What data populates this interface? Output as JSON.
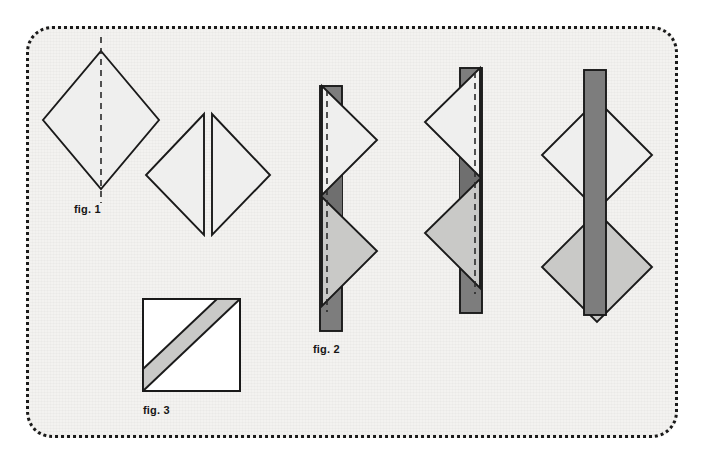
{
  "document": {
    "title": "Geometric Folding Diagram",
    "background_color": "#ffffff",
    "paper_color": "#f3f2f0",
    "border_style": "dotted-rounded-rectangle",
    "border_color": "#1a1a1a"
  },
  "palette": {
    "stroke": "#1a1a1a",
    "light_fill": "#efefee",
    "mid_fill": "#c9c9c7",
    "dark_fill": "#7d7d7d",
    "overlap_fill": "#6f6f6f",
    "paper": "#f3f2f0",
    "white": "#ffffff"
  },
  "labels": {
    "fig1": "fig. 1",
    "fig2": "fig. 2",
    "fig3": "fig. 3"
  },
  "figures": [
    {
      "id": "fig1",
      "label": "fig. 1",
      "description": "Light gray diamond with a vertical dashed fold line through its center",
      "shapes": [
        "diamond",
        "dashed-fold-line"
      ]
    },
    {
      "id": "fig1-split",
      "label": "",
      "description": "The same diamond separated into two mirrored triangles with a gap between them",
      "shapes": [
        "left-triangle",
        "right-triangle"
      ]
    },
    {
      "id": "fig2",
      "label": "fig. 2",
      "description": "Dark vertical bar overlaid by two right-pointing triangles with a dashed fold line",
      "shapes": [
        "vertical-bar",
        "upper-triangle",
        "lower-triangle",
        "dashed-fold-line",
        "overlap-region"
      ]
    },
    {
      "id": "fig2-mirror",
      "label": "",
      "description": "Mirrored arrangement with two left-pointing triangles over a dark vertical bar and dashed fold line",
      "shapes": [
        "vertical-bar",
        "upper-triangle",
        "lower-triangle",
        "dashed-fold-line",
        "overlap-region"
      ]
    },
    {
      "id": "fig2-joined",
      "label": "",
      "description": "Two stacked diamonds crossed by a dark vertical bar drawn on top",
      "shapes": [
        "upper-diamond",
        "lower-diamond",
        "vertical-bar"
      ]
    },
    {
      "id": "fig3",
      "label": "fig. 3",
      "description": "Square containing a diagonal gray band running from lower-left to upper-right",
      "shapes": [
        "square",
        "diagonal-band"
      ]
    }
  ]
}
